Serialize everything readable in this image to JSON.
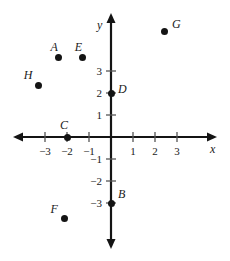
{
  "chart_data": {
    "type": "scatter",
    "title": "",
    "xlabel": "x",
    "ylabel": "y",
    "xlim": [
      -3.8,
      3.8
    ],
    "ylim": [
      -4.2,
      4.2
    ],
    "grid": false,
    "legend": "none",
    "x_ticks": [
      -3,
      -2,
      -1,
      1,
      2,
      3
    ],
    "y_ticks": [
      -3,
      -2,
      -1,
      1,
      2,
      3
    ],
    "x_tick_labels": [
      "−3",
      "−2",
      "−1",
      "1",
      "2",
      "3"
    ],
    "y_tick_labels": [
      "−3",
      "−2",
      "−1",
      "1",
      "2",
      "3"
    ],
    "points": [
      {
        "name": "A",
        "x": -2.4,
        "y": 3.6
      },
      {
        "name": "B",
        "x": 0,
        "y": -3
      },
      {
        "name": "C",
        "x": -2,
        "y": 0
      },
      {
        "name": "D",
        "x": 0,
        "y": 2
      },
      {
        "name": "E",
        "x": -1.3,
        "y": 3.6
      },
      {
        "name": "F",
        "x": -2.1,
        "y": -3.7
      },
      {
        "name": "G",
        "x": 2.45,
        "y": 4.8
      },
      {
        "name": "H",
        "x": -3.3,
        "y": 2.35
      }
    ]
  },
  "axes": {
    "x_axis_name": "x-axis",
    "y_axis_name": "y-axis",
    "x_label": "x",
    "y_label": "y"
  },
  "geometry": {
    "origin_x": 111,
    "origin_y": 137,
    "unit": 22
  }
}
